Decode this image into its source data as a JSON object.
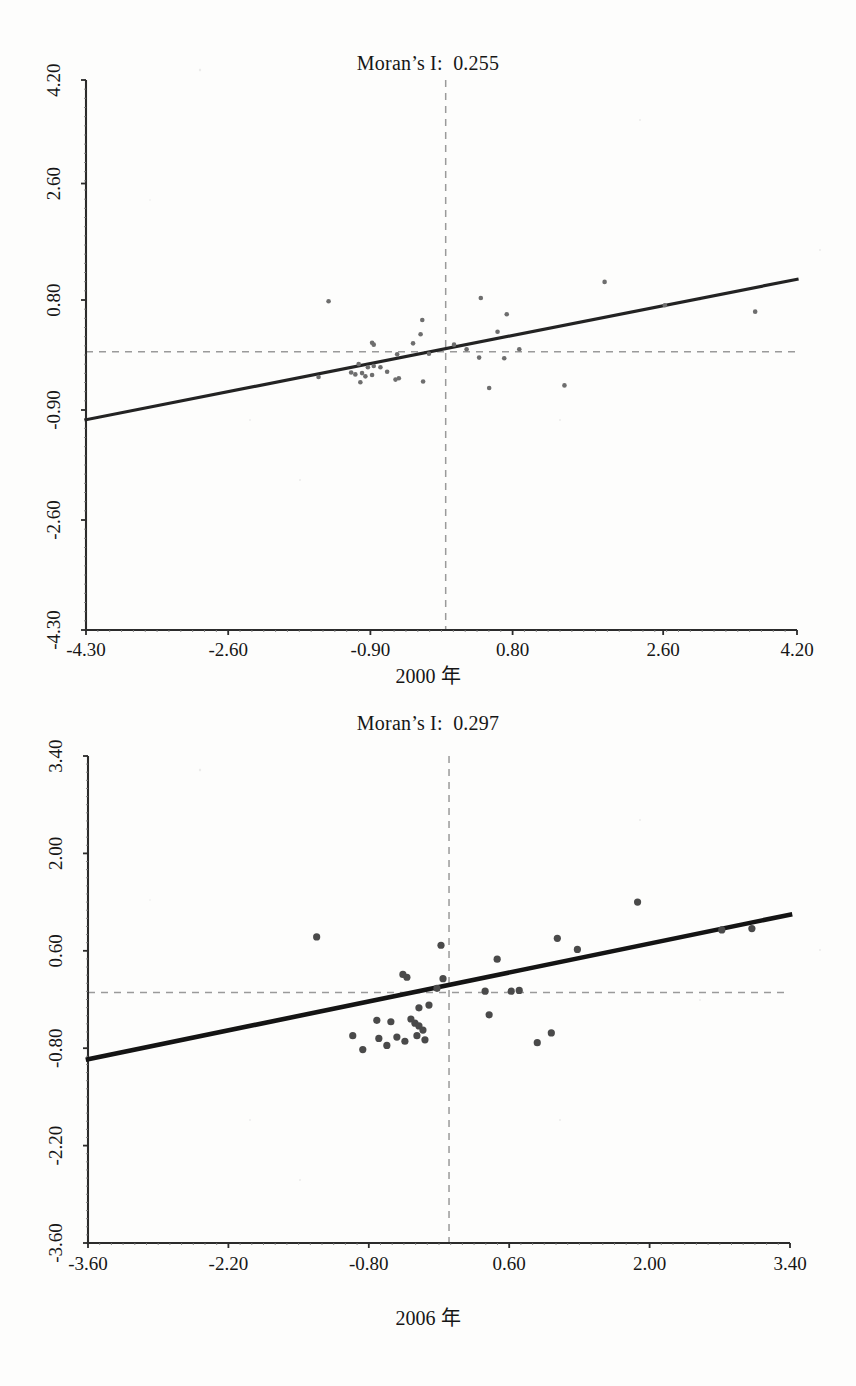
{
  "page": {
    "background": "#fdfdfc",
    "ink": "#161616"
  },
  "figures": [
    {
      "id": "moran-2000",
      "title": "Moran’s I:  0.255",
      "caption": "2000 年"
    },
    {
      "id": "moran-2006",
      "title": "Moran’s I:  0.297",
      "caption": "2006 年"
    }
  ],
  "chart_data": [
    {
      "type": "scatter",
      "title": "Moran’s I:  0.255",
      "xlabel": "2000 年",
      "ylabel": "",
      "xlim": [
        -4.3,
        4.2
      ],
      "ylim": [
        -4.3,
        4.2
      ],
      "xticks": [
        "-4.30",
        "-2.60",
        "-0.90",
        "0.80",
        "2.60",
        "4.20"
      ],
      "xtick_values": [
        -4.3,
        -2.6,
        -0.9,
        0.8,
        2.6,
        4.2
      ],
      "yticks": [
        "-4.30",
        "-2.60",
        "-0.90",
        "0.80",
        "2.60",
        "4.20"
      ],
      "ytick_values": [
        -4.3,
        -2.6,
        -0.9,
        0.8,
        2.6,
        4.2
      ],
      "grid": false,
      "legend": "none",
      "annotations": [
        "Moran's I: 0.255"
      ],
      "reference_lines": {
        "vertical_x": 0.0,
        "horizontal_y": 0.0,
        "style": "dashed grey"
      },
      "fit_line": {
        "slope": 0.255,
        "intercept": 0.04,
        "x_start": -4.3,
        "x_end": 4.2,
        "y_start": -1.05,
        "y_end": 1.12
      },
      "points": [
        [
          -1.4,
          0.78
        ],
        [
          0.42,
          0.83
        ],
        [
          1.9,
          1.08
        ],
        [
          2.62,
          0.72
        ],
        [
          3.7,
          0.62
        ],
        [
          0.73,
          0.58
        ],
        [
          -0.28,
          0.49
        ],
        [
          0.62,
          0.31
        ],
        [
          -0.3,
          0.27
        ],
        [
          -0.88,
          0.14
        ],
        [
          -0.86,
          0.11
        ],
        [
          -0.39,
          0.13
        ],
        [
          0.1,
          0.11
        ],
        [
          0.25,
          0.04
        ],
        [
          0.88,
          0.04
        ],
        [
          -0.58,
          -0.04
        ],
        [
          -0.2,
          -0.03
        ],
        [
          0.4,
          -0.09
        ],
        [
          0.7,
          -0.1
        ],
        [
          -1.04,
          -0.19
        ],
        [
          -0.93,
          -0.24
        ],
        [
          -0.86,
          -0.22
        ],
        [
          -0.78,
          -0.24
        ],
        [
          -1.13,
          -0.32
        ],
        [
          -1.08,
          -0.35
        ],
        [
          -1.0,
          -0.33
        ],
        [
          -0.96,
          -0.38
        ],
        [
          -0.88,
          -0.36
        ],
        [
          -0.7,
          -0.31
        ],
        [
          -1.52,
          -0.39
        ],
        [
          -1.02,
          -0.47
        ],
        [
          -0.6,
          -0.43
        ],
        [
          -0.56,
          -0.41
        ],
        [
          -0.27,
          -0.46
        ],
        [
          0.52,
          -0.56
        ],
        [
          1.42,
          -0.52
        ]
      ]
    },
    {
      "type": "scatter",
      "title": "Moran’s I:  0.297",
      "xlabel": "2006 年",
      "ylabel": "",
      "xlim": [
        -3.6,
        3.4
      ],
      "ylim": [
        -3.6,
        3.4
      ],
      "xticks": [
        "-3.60",
        "-2.20",
        "-0.80",
        "0.60",
        "2.00",
        "3.40"
      ],
      "xtick_values": [
        -3.6,
        -2.2,
        -0.8,
        0.6,
        2.0,
        3.4
      ],
      "yticks": [
        "-3.60",
        "-2.20",
        "-0.80",
        "0.60",
        "2.00",
        "3.40"
      ],
      "ytick_values": [
        -3.6,
        -2.2,
        -0.8,
        0.6,
        2.0,
        3.4
      ],
      "grid": false,
      "legend": "none",
      "annotations": [
        "Moran's I: 0.297"
      ],
      "reference_lines": {
        "vertical_x": 0.0,
        "horizontal_y": 0.0,
        "style": "dashed grey"
      },
      "fit_line": {
        "slope": 0.297,
        "intercept": 0.05,
        "x_start": -3.6,
        "x_end": 3.4,
        "y_start": -0.96,
        "y_end": 1.12
      },
      "points": [
        [
          -1.32,
          0.8
        ],
        [
          1.88,
          1.3
        ],
        [
          1.08,
          0.78
        ],
        [
          2.72,
          0.9
        ],
        [
          3.02,
          0.92
        ],
        [
          1.28,
          0.62
        ],
        [
          -0.08,
          0.68
        ],
        [
          0.48,
          0.48
        ],
        [
          -0.06,
          0.2
        ],
        [
          -0.42,
          0.22
        ],
        [
          -0.46,
          0.26
        ],
        [
          -0.12,
          0.06
        ],
        [
          0.36,
          0.02
        ],
        [
          0.62,
          0.02
        ],
        [
          0.7,
          0.03
        ],
        [
          -0.3,
          -0.22
        ],
        [
          -0.2,
          -0.18
        ],
        [
          0.4,
          -0.32
        ],
        [
          -0.72,
          -0.4
        ],
        [
          -0.58,
          -0.42
        ],
        [
          -0.38,
          -0.38
        ],
        [
          -0.34,
          -0.44
        ],
        [
          -0.3,
          -0.48
        ],
        [
          -0.26,
          -0.54
        ],
        [
          -0.96,
          -0.62
        ],
        [
          -0.7,
          -0.66
        ],
        [
          -0.52,
          -0.64
        ],
        [
          -0.44,
          -0.7
        ],
        [
          -0.32,
          -0.62
        ],
        [
          -0.24,
          -0.68
        ],
        [
          -0.62,
          -0.76
        ],
        [
          -0.86,
          -0.82
        ],
        [
          0.88,
          -0.72
        ],
        [
          1.02,
          -0.58
        ]
      ]
    }
  ]
}
